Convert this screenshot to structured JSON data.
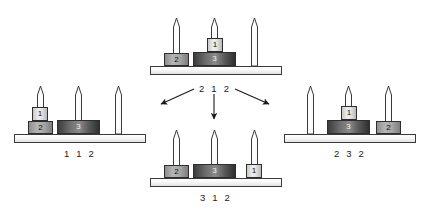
{
  "figure": {
    "type": "state-transition-diagram",
    "background_color": "#ffffff",
    "disk_colors": {
      "disk1": "#e4e4e4",
      "disk2": "#a6a6a6",
      "disk3": "#5a5a5a",
      "base": "#f7f7f7",
      "outline": "#2e2e2e"
    }
  },
  "transition": {
    "label": "2 1 2",
    "from_state": "2 1 2",
    "arrows": [
      {
        "name": "arrow-to-left-state",
        "direction": "down-left",
        "target_state": "1 1 2"
      },
      {
        "name": "arrow-to-bottom-state",
        "direction": "down",
        "target_state": "3 1 2"
      },
      {
        "name": "arrow-to-right-state",
        "direction": "down-right",
        "target_state": "2 3 2"
      }
    ]
  },
  "configurations": [
    {
      "id": "top",
      "label": "2 1 2",
      "label_shown": false,
      "pegs": [
        {
          "peg": 1,
          "disks": [
            2
          ]
        },
        {
          "peg": 2,
          "disks": [
            3,
            1
          ]
        },
        {
          "peg": 3,
          "disks": []
        }
      ]
    },
    {
      "id": "left",
      "label": "1 1 2",
      "label_shown": true,
      "pegs": [
        {
          "peg": 1,
          "disks": [
            2,
            1
          ]
        },
        {
          "peg": 2,
          "disks": [
            3
          ]
        },
        {
          "peg": 3,
          "disks": []
        }
      ]
    },
    {
      "id": "bottom",
      "label": "3 1 2",
      "label_shown": true,
      "pegs": [
        {
          "peg": 1,
          "disks": [
            2
          ]
        },
        {
          "peg": 2,
          "disks": [
            3
          ]
        },
        {
          "peg": 3,
          "disks": [
            1
          ]
        }
      ]
    },
    {
      "id": "right",
      "label": "2 3 2",
      "label_shown": true,
      "pegs": [
        {
          "peg": 1,
          "disks": []
        },
        {
          "peg": 2,
          "disks": [
            3,
            1
          ]
        },
        {
          "peg": 3,
          "disks": [
            2
          ]
        }
      ]
    }
  ],
  "disk_labels": {
    "1": "1",
    "2": "2",
    "3": "3"
  }
}
